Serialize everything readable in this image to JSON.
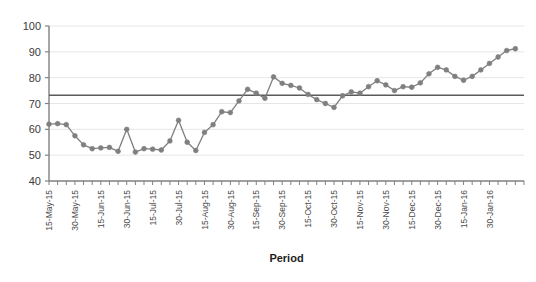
{
  "chart_data": {
    "type": "line",
    "title": "",
    "subtitle": "",
    "xlabel": "Period",
    "ylabel": "",
    "ylim": [
      40,
      100
    ],
    "ytick_step": 10,
    "yticks": [
      40,
      50,
      60,
      70,
      80,
      90,
      100
    ],
    "grid": true,
    "grid_axis": "y",
    "legend": "none",
    "legend_position": "none",
    "marker": "circle",
    "series_color": "#7f7f7f",
    "reference_line_color": "#5a5a5a",
    "gridline_color": "#e6e6e6",
    "axis_color": "#808080",
    "categories": [
      "15-May-15",
      "",
      "",
      "30-May-15",
      "",
      "",
      "15-Jun-15",
      "",
      "",
      "30-Jun-15",
      "",
      "",
      "15-Jul-15",
      "",
      "",
      "30-Jul-15",
      "",
      "",
      "15-Aug-15",
      "",
      "",
      "30-Aug-15",
      "",
      "",
      "15-Sep-15",
      "",
      "",
      "30-Sep-15",
      "",
      "",
      "15-Oct-15",
      "",
      "",
      "30-Oct-15",
      "",
      "",
      "15-Nov-15",
      "",
      "",
      "30-Nov-15",
      "",
      "",
      "15-Dec-15",
      "",
      "",
      "30-Dec-15",
      "",
      "",
      "15-Jan-16",
      "",
      "",
      "30-Jan-16",
      "",
      "",
      ""
    ],
    "xtick_labels_shown": [
      "15-May-15",
      "30-May-15",
      "15-Jun-15",
      "30-Jun-15",
      "15-Jul-15",
      "30-Jul-15",
      "15-Aug-15",
      "30-Aug-15",
      "15-Sep-15",
      "30-Sep-15",
      "15-Oct-15",
      "30-Oct-15",
      "15-Nov-15",
      "30-Nov-15",
      "15-Dec-15",
      "30-Dec-15",
      "15-Jan-16",
      "30-Jan-16"
    ],
    "xtick_label_interval": 3,
    "n_points": 55,
    "values": [
      62.0,
      62.2,
      61.8,
      57.5,
      54.0,
      52.5,
      52.8,
      53.0,
      51.5,
      60.0,
      51.2,
      52.5,
      52.3,
      52.0,
      55.5,
      63.5,
      55.0,
      51.8,
      58.8,
      61.8,
      66.8,
      66.5,
      71.0,
      75.5,
      74.0,
      72.0,
      80.3,
      77.8,
      77.0,
      76.0,
      73.5,
      71.5,
      70.0,
      68.5,
      73.0,
      74.5,
      74.0,
      76.5,
      78.8,
      77.2,
      75.0,
      76.5,
      76.3,
      78.0,
      81.5,
      84.0,
      83.0,
      80.5,
      79.0,
      80.5,
      83.0,
      85.5,
      88.0,
      90.5,
      91.2
    ],
    "reference_line_value": 73.2,
    "annotations": []
  }
}
